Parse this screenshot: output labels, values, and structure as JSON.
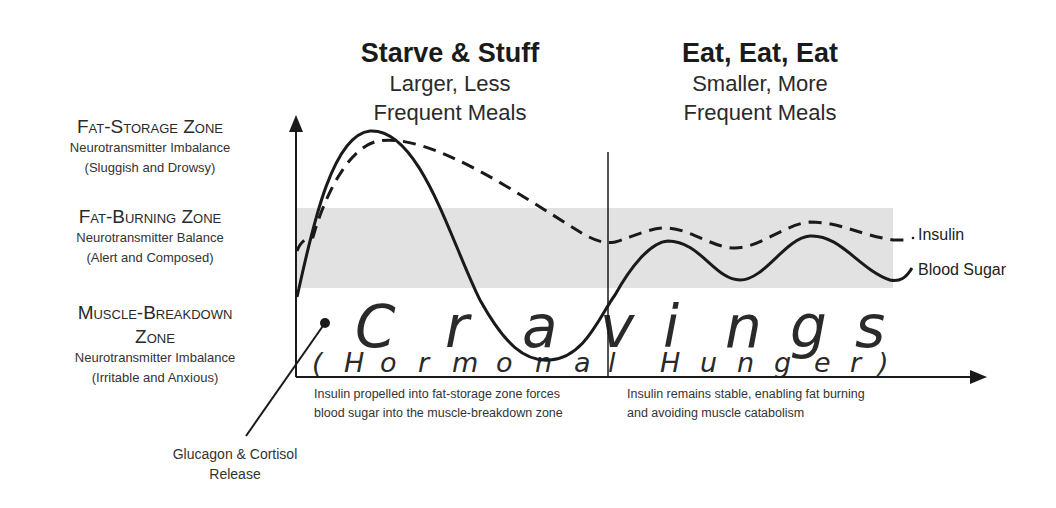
{
  "headers": {
    "left": {
      "title": "Starve & Stuff",
      "line1": "Larger, Less",
      "line2": "Frequent Meals"
    },
    "right": {
      "title": "Eat, Eat, Eat",
      "line1": "Smaller, More",
      "line2": "Frequent Meals"
    }
  },
  "zones": [
    {
      "title": "Fat-Storage Zone",
      "line1": "Neurotransmitter Imbalance",
      "line2": "(Sluggish and Drowsy)"
    },
    {
      "title": "Fat-Burning Zone",
      "line1": "Neurotransmitter Balance",
      "line2": "(Alert and Composed)"
    },
    {
      "title_a": "Muscle-Breakdown",
      "title_b": "Zone",
      "line1": "Neurotransmitter Imbalance",
      "line2": "(Irritable and Anxious)"
    }
  ],
  "legend": {
    "insulin": "Insulin",
    "blood_sugar": "Blood Sugar"
  },
  "cravings": {
    "word": [
      "C",
      "r",
      "a",
      "v",
      "i",
      "n",
      "g",
      "s"
    ],
    "sub": [
      "(",
      "H",
      "o",
      "r",
      "m",
      "o",
      "n",
      "a",
      "l",
      "H",
      "u",
      "n",
      "g",
      "e",
      "r",
      ")"
    ]
  },
  "captions": {
    "left_1": "Insulin propelled into fat-storage zone forces",
    "left_2": "blood sugar into the muscle-breakdown zone",
    "right_1": "Insulin remains stable, enabling fat burning",
    "right_2": "and avoiding muscle catabolism"
  },
  "callout": {
    "line1": "Glucagon & Cortisol",
    "line2": "Release"
  },
  "colors": {
    "band": "#e2e2e2",
    "line": "#1a1a1a"
  }
}
